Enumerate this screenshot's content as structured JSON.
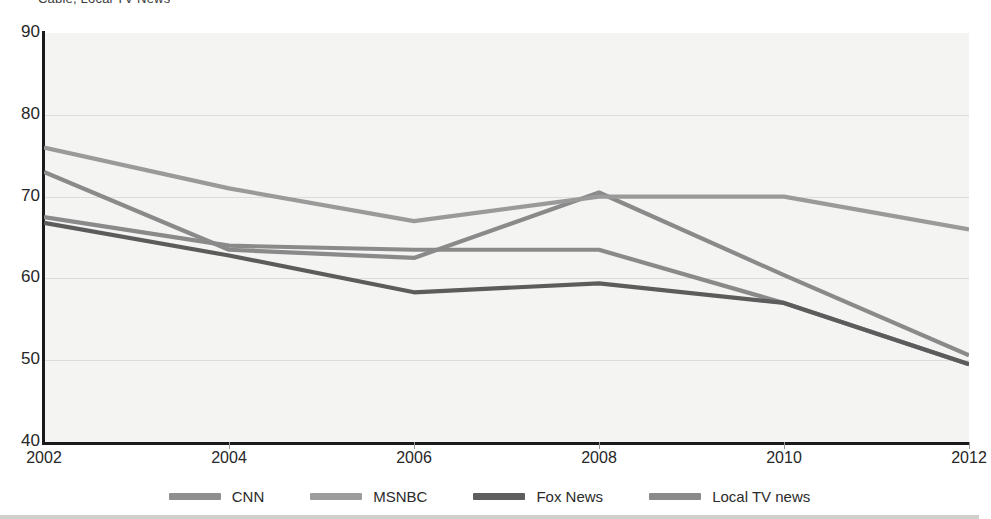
{
  "title_clipped": "Cable, Local TV News",
  "chart_data": {
    "type": "line",
    "title": "Cable, Local TV News",
    "xlabel": "",
    "ylabel": "",
    "x": [
      2002,
      2004,
      2006,
      2008,
      2010,
      2012
    ],
    "xtick_labels": [
      "2002",
      "2004",
      "2006",
      "2008",
      "2010",
      "2012"
    ],
    "ytick_labels": [
      "90",
      "80",
      "70",
      "60",
      "50",
      "40"
    ],
    "yticks": [
      90,
      80,
      70,
      60,
      50,
      40
    ],
    "ylim": [
      40,
      90
    ],
    "xlim": [
      2002,
      2012
    ],
    "grid": true,
    "legend_position": "bottom",
    "series": [
      {
        "name": "CNN",
        "color": "#8a8a8a",
        "values": [
          73.0,
          63.5,
          62.5,
          70.5,
          60.4,
          50.6
        ]
      },
      {
        "name": "MSNBC",
        "color": "#8a8a8a",
        "values": [
          67.5,
          64.0,
          63.5,
          63.5,
          57.0,
          49.5
        ]
      },
      {
        "name": "Fox News",
        "color": "#5c5c5c",
        "values": [
          66.8,
          62.8,
          58.3,
          59.4,
          57.0,
          49.5
        ]
      },
      {
        "name": "Local TV news",
        "color": "#9a9a9a",
        "values": [
          76.0,
          71.0,
          67.0,
          70.0,
          70.0,
          66.0
        ]
      }
    ]
  },
  "legend": {
    "items": [
      {
        "label": "CNN",
        "color": "#8f8f8f"
      },
      {
        "label": "MSNBC",
        "color": "#9c9c9c"
      },
      {
        "label": "Fox News",
        "color": "#5e5e5e"
      },
      {
        "label": "Local TV news",
        "color": "#8a8a8a"
      }
    ]
  },
  "colors": {
    "plot_background": "#f4f4f2",
    "axis": "#1a1a1a",
    "gridline": "#dcdcd8",
    "text": "#272727"
  }
}
